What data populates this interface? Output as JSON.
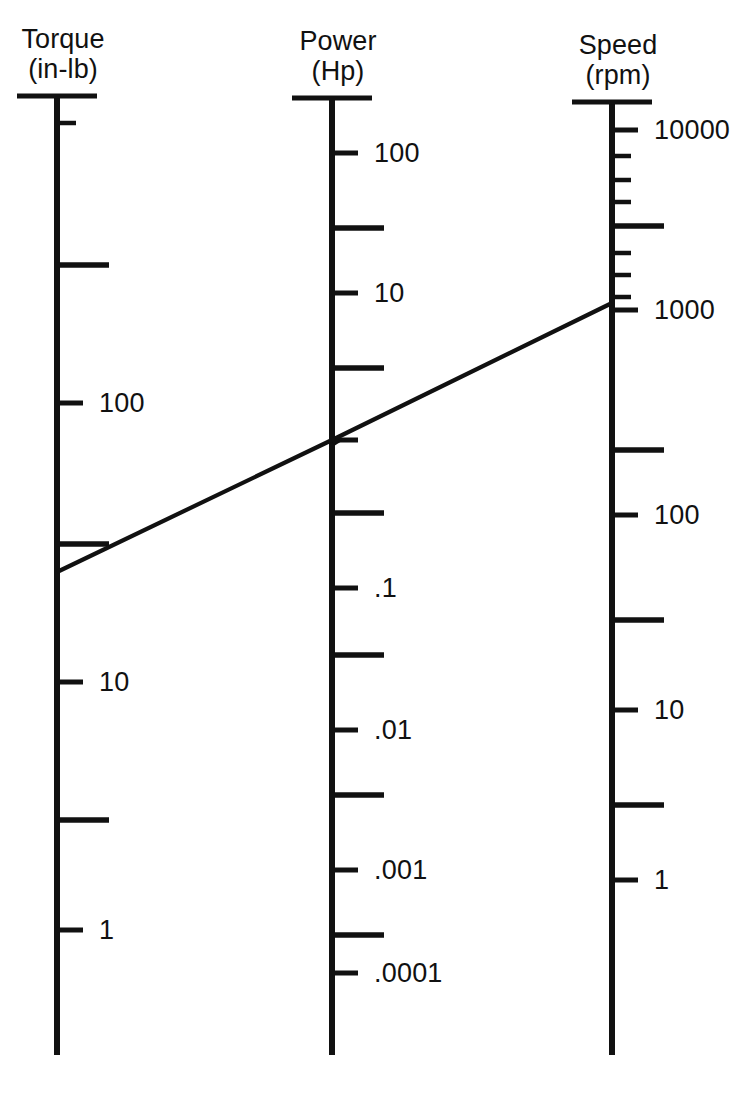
{
  "figure": {
    "kind": "nomogram",
    "background_color": "#ffffff",
    "ink_color": "#111111"
  },
  "scales": [
    {
      "id": "torque",
      "name": "Torque",
      "unit": "(in-lb)",
      "axis_x": 57,
      "top_y": 96,
      "bottom_y": 1055,
      "labels": [
        {
          "text": "100",
          "y": 403
        },
        {
          "text": "10",
          "y": 682
        },
        {
          "text": "1",
          "y": 930
        }
      ],
      "ticks": [
        {
          "kind": "minor",
          "y": 123
        },
        {
          "kind": "long",
          "y": 265
        },
        {
          "kind": "major",
          "y": 403
        },
        {
          "kind": "long",
          "y": 544
        },
        {
          "kind": "major",
          "y": 682
        },
        {
          "kind": "long",
          "y": 820
        },
        {
          "kind": "major",
          "y": 930
        }
      ]
    },
    {
      "id": "power",
      "name": "Power",
      "unit": "(Hp)",
      "axis_x": 332,
      "top_y": 98,
      "bottom_y": 1055,
      "labels": [
        {
          "text": "100",
          "y": 153
        },
        {
          "text": "10",
          "y": 293
        },
        {
          "text": ".1",
          "y": 588
        },
        {
          "text": ".01",
          "y": 730
        },
        {
          "text": ".001",
          "y": 870
        },
        {
          "text": ".0001",
          "y": 973
        }
      ],
      "ticks": [
        {
          "kind": "major",
          "y": 153
        },
        {
          "kind": "long",
          "y": 228
        },
        {
          "kind": "major",
          "y": 293
        },
        {
          "kind": "long",
          "y": 368
        },
        {
          "kind": "major",
          "y": 440
        },
        {
          "kind": "long",
          "y": 513
        },
        {
          "kind": "major",
          "y": 588
        },
        {
          "kind": "long",
          "y": 655
        },
        {
          "kind": "major",
          "y": 730
        },
        {
          "kind": "long",
          "y": 795
        },
        {
          "kind": "major",
          "y": 870
        },
        {
          "kind": "long",
          "y": 935
        },
        {
          "kind": "major",
          "y": 973
        }
      ]
    },
    {
      "id": "speed",
      "name": "Speed",
      "unit": "(rpm)",
      "axis_x": 612,
      "top_y": 102,
      "bottom_y": 1055,
      "labels": [
        {
          "text": "10000",
          "y": 130
        },
        {
          "text": "1000",
          "y": 310
        },
        {
          "text": "100",
          "y": 515
        },
        {
          "text": "10",
          "y": 710
        },
        {
          "text": "1",
          "y": 880
        }
      ],
      "ticks": [
        {
          "kind": "major",
          "y": 130
        },
        {
          "kind": "minor",
          "y": 156
        },
        {
          "kind": "minor",
          "y": 180
        },
        {
          "kind": "minor",
          "y": 202
        },
        {
          "kind": "long",
          "y": 226
        },
        {
          "kind": "minor",
          "y": 253
        },
        {
          "kind": "minor",
          "y": 275
        },
        {
          "kind": "minor",
          "y": 297
        },
        {
          "kind": "major",
          "y": 310
        },
        {
          "kind": "long",
          "y": 450
        },
        {
          "kind": "major",
          "y": 515
        },
        {
          "kind": "long",
          "y": 620
        },
        {
          "kind": "major",
          "y": 710
        },
        {
          "kind": "long",
          "y": 805
        },
        {
          "kind": "major",
          "y": 880
        }
      ]
    }
  ],
  "iso_line": {
    "label": "isopleth",
    "points": [
      {
        "scale": "torque",
        "x": 57,
        "y": 572
      },
      {
        "scale": "power",
        "x": 332,
        "y": 440
      },
      {
        "scale": "speed",
        "x": 612,
        "y": 303
      }
    ],
    "marker": {
      "x": 340,
      "y": 437
    }
  },
  "chart_data": {
    "type": "line",
    "title": "",
    "xlabel": "",
    "ylabel": "",
    "series": [
      {
        "name": "isopleth",
        "readings": [
          {
            "scale": "Torque (in-lb)",
            "value": 40
          },
          {
            "scale": "Power (Hp)",
            "value": 0.8
          },
          {
            "scale": "Speed (rpm)",
            "value": 1300
          }
        ]
      }
    ],
    "axes": [
      {
        "name": "Torque",
        "unit": "in-lb",
        "orientation": "vertical",
        "scale": "log",
        "direction": "decreasing-downward",
        "tick_labels": [
          "100",
          "10",
          "1"
        ],
        "tick_values": [
          100,
          10,
          1
        ],
        "range": [
          0.5,
          1000
        ]
      },
      {
        "name": "Power",
        "unit": "Hp",
        "orientation": "vertical",
        "scale": "log",
        "direction": "decreasing-downward",
        "tick_labels": [
          "100",
          "10",
          ".1",
          ".01",
          ".001",
          ".0001"
        ],
        "tick_values": [
          100,
          10,
          0.1,
          0.01,
          0.001,
          0.0001
        ],
        "range": [
          0.0001,
          1000
        ]
      },
      {
        "name": "Speed",
        "unit": "rpm",
        "orientation": "vertical",
        "scale": "log",
        "direction": "decreasing-downward",
        "tick_labels": [
          "10000",
          "1000",
          "100",
          "10",
          "1"
        ],
        "tick_values": [
          10000,
          1000,
          100,
          10,
          1
        ],
        "range": [
          0.5,
          20000
        ]
      }
    ],
    "legend": [],
    "grid": false
  }
}
